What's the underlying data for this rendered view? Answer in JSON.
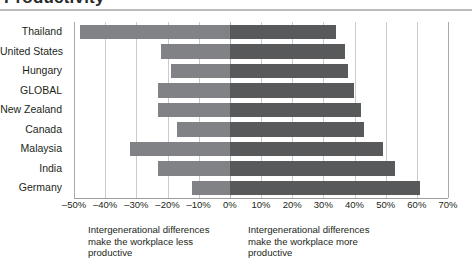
{
  "figure": {
    "title": "Productivity",
    "left_caption": [
      "Intergenerational differences",
      "make the workplace less",
      "productive"
    ],
    "right_caption": [
      "Intergenerational differences",
      "make the workplace more",
      "productive"
    ]
  },
  "chart_data": {
    "type": "bar",
    "orientation": "horizontal",
    "style": "diverging",
    "title": "Productivity",
    "xlabel": "",
    "ylabel": "",
    "xlim": [
      -50,
      70
    ],
    "xticks": [
      "-50%",
      "-40%",
      "-30%",
      "-20%",
      "-10%",
      "0%",
      "10%",
      "20%",
      "30%",
      "40%",
      "50%",
      "60%",
      "70%"
    ],
    "xtick_values": [
      -50,
      -40,
      -30,
      -20,
      -10,
      0,
      10,
      20,
      30,
      40,
      50,
      60,
      70
    ],
    "grid": true,
    "legend": false,
    "categories": [
      "Thailand",
      "United States",
      "Hungary",
      "GLOBAL",
      "New Zealand",
      "Canada",
      "Malaysia",
      "India",
      "Germany"
    ],
    "series": [
      {
        "name": "Intergenerational differences make the workplace less productive",
        "color": "#808285",
        "values": [
          -48,
          -22,
          -19,
          -23,
          -23,
          -17,
          -32,
          -23,
          -12
        ]
      },
      {
        "name": "Intergenerational differences make the workplace more productive",
        "color": "#58595b",
        "values": [
          34,
          37,
          38,
          40,
          42,
          43,
          49,
          53,
          61
        ]
      }
    ],
    "annotations": [
      "Intergenerational differences make the workplace less productive",
      "Intergenerational differences make the workplace more productive"
    ]
  },
  "colors": {
    "negative_bar": "#808285",
    "positive_bar": "#58595b",
    "gridline": "#c9ccce",
    "rule": "#b9bcbe",
    "text": "#231f20"
  }
}
